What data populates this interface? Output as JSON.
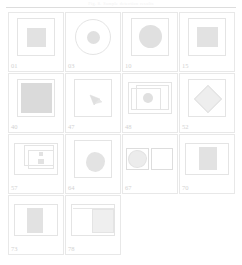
{
  "page": {
    "header_text": "Fig. 8.  Sample detection results",
    "width": 242,
    "height": 265,
    "background_color": "#ffffff",
    "rule_color": "#dddddd",
    "cell_border_color": "#e8e8e8",
    "shape_fill_color": "#e2e2e2",
    "shape_outline_color": "#e4e4e4",
    "label_color": "#d2d2d2"
  },
  "grid": {
    "columns": 4,
    "rows": [
      {
        "cells": [
          {
            "label": "01",
            "shape": "square-in-frame"
          },
          {
            "label": "03",
            "shape": "circle-in-circle"
          },
          {
            "label": "10",
            "shape": "circle-in-frame"
          },
          {
            "label": "15",
            "shape": "square-in-frame"
          }
        ]
      },
      {
        "cells": [
          {
            "label": "40",
            "shape": "large-square-in-frame"
          },
          {
            "label": "47",
            "shape": "triangle-wedge-in-frame"
          },
          {
            "label": "48",
            "shape": "circle-in-nested-rects"
          },
          {
            "label": "52",
            "shape": "diamond-in-frame"
          }
        ]
      },
      {
        "cells": [
          {
            "label": "57",
            "shape": "nested-rects-with-marks"
          },
          {
            "label": "64",
            "shape": "blob-in-frame"
          },
          {
            "label": "67",
            "shape": "two-boxes-circle-left"
          },
          {
            "label": "70",
            "shape": "square-in-wide-frame"
          }
        ]
      },
      {
        "cells": [
          {
            "label": "73",
            "shape": "square-in-wide-frame"
          },
          {
            "label": "78",
            "shape": "split-wide-frame"
          }
        ]
      }
    ]
  }
}
